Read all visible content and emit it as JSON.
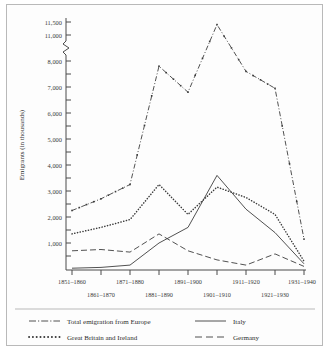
{
  "chart_data": {
    "type": "line",
    "title": "",
    "xlabel": "",
    "ylabel": "Emigrants (in thousands)",
    "grid": false,
    "legend_position": "bottom",
    "axis_break": {
      "from": 8000,
      "to": 11000,
      "note": "y-axis broken between 8,000 and 11,000"
    },
    "ylim": [
      0,
      11500
    ],
    "ytick_labels": [
      "1,000",
      "2,000",
      "3,000",
      "4,000",
      "5,000",
      "6,000",
      "7,000",
      "8,000",
      "11,000",
      "11,500"
    ],
    "ytick_values": [
      1000,
      2000,
      3000,
      4000,
      5000,
      6000,
      7000,
      8000,
      11000,
      11500
    ],
    "categories": [
      "1851–1860",
      "1861–1870",
      "1871–1880",
      "1881–1890",
      "1891–1900",
      "1901–1910",
      "1911–1920",
      "1921–1930",
      "1931–1940"
    ],
    "xtick_labels_row_top": [
      "1851–1860",
      "1871–1880",
      "1891–1900",
      "1911–1920",
      "1931–1940"
    ],
    "xtick_labels_row_bottom": [
      "1861–1870",
      "1881–1890",
      "1901–1910",
      "1921–1930"
    ],
    "series": [
      {
        "name": "Total emigration from Europe",
        "style": "dash-dot",
        "values": [
          2250,
          2700,
          3250,
          7800,
          6800,
          11400,
          7600,
          6950,
          1150
        ]
      },
      {
        "name": "Great Britain and Ireland",
        "style": "dotted",
        "values": [
          1350,
          1600,
          1900,
          3250,
          2100,
          3150,
          2750,
          2100,
          300
        ]
      },
      {
        "name": "Italy",
        "style": "solid",
        "values": [
          30,
          60,
          150,
          1000,
          1600,
          3600,
          2300,
          1400,
          200
        ]
      },
      {
        "name": "Germany",
        "style": "dashed",
        "values": [
          700,
          750,
          650,
          1350,
          700,
          350,
          150,
          580,
          100
        ]
      }
    ]
  },
  "legend": {
    "entries": [
      {
        "label": "Total emigration from Europe",
        "style": "dash-dot"
      },
      {
        "label": "Italy",
        "style": "solid"
      },
      {
        "label": "Great Britain and Ireland",
        "style": "dotted"
      },
      {
        "label": "Germany",
        "style": "dashed"
      }
    ]
  }
}
